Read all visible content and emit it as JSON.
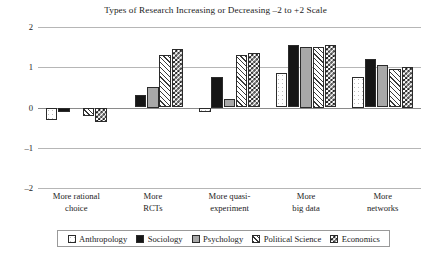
{
  "chart_data": {
    "type": "bar",
    "title": "Types of Research Increasing or Decreasing –2 to +2 Scale",
    "xlabel": "",
    "ylabel": "",
    "ylim": [
      -2,
      2
    ],
    "yticks": [
      2,
      1,
      0,
      -1,
      -2
    ],
    "ytick_labels": [
      "2",
      "1",
      "0",
      "–1",
      "–2"
    ],
    "grid": true,
    "legend_position": "bottom",
    "categories": [
      "More rational choice",
      "More RCTs",
      "More quasi-experiment",
      "More big data",
      "More networks"
    ],
    "category_lines": [
      [
        "More rational",
        "choice"
      ],
      [
        "More",
        "RCTs"
      ],
      [
        "More quasi-",
        "experiment"
      ],
      [
        "More",
        "big data"
      ],
      [
        "More",
        "networks"
      ]
    ],
    "series": [
      {
        "name": "Anthropology",
        "swatch": "white-dotted",
        "color": "#ffffff",
        "values": [
          -0.3,
          0.0,
          -0.1,
          0.85,
          0.75
        ]
      },
      {
        "name": "Sociology",
        "swatch": "black-solid",
        "color": "#161616",
        "values": [
          -0.1,
          0.3,
          0.75,
          1.55,
          1.2
        ]
      },
      {
        "name": "Psychology",
        "swatch": "gray-solid",
        "color": "#a8a8a8",
        "values": [
          0.0,
          0.5,
          0.2,
          1.5,
          1.05
        ]
      },
      {
        "name": "Political Science",
        "swatch": "white-diagonal-hatch",
        "color": "#ffffff",
        "values": [
          -0.2,
          1.3,
          1.3,
          1.5,
          0.95
        ]
      },
      {
        "name": "Economics",
        "swatch": "checkerboard",
        "color": "#151515",
        "values": [
          -0.35,
          1.45,
          1.35,
          1.55,
          1.0
        ]
      }
    ]
  }
}
